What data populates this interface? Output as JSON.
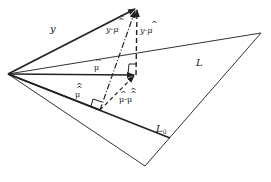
{
  "diagram": {
    "type": "geometric vector projection diagram",
    "labels": {
      "y": "y",
      "y_minus_mu_hat_hat": "y-μ",
      "y_minus_mu_hat": "y-μ",
      "mu_hat": "μ",
      "mu_hat_hat": "μ",
      "mu_hat_minus_mu_hat_hat": "μ-μ",
      "plane_L": "L",
      "subspace_L0": "L",
      "subspace_L0_sub": "0"
    },
    "colors": {
      "line": "#222222",
      "background": "#ffffff"
    },
    "points": {
      "origin": [
        8,
        74
      ],
      "y_tip": [
        137,
        8
      ],
      "mu_hat_tip": [
        136,
        75
      ],
      "mu_hat_hat_tip": [
        100,
        110
      ],
      "plane_top_right": [
        261,
        33
      ],
      "plane_bottom": [
        145,
        166
      ],
      "L0_end": [
        170,
        138
      ]
    }
  }
}
